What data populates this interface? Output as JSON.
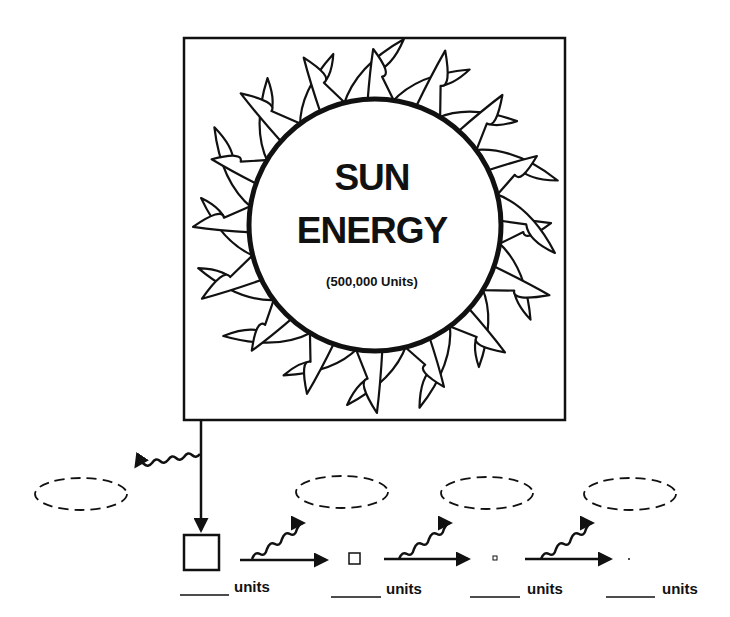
{
  "diagram": {
    "sun": {
      "title_line1": "SUN",
      "title_line2": "ENERGY",
      "amount": "(500,000 Units)"
    },
    "levels": [
      {
        "box_size": "large",
        "blank": "______",
        "label": "units"
      },
      {
        "box_size": "medium",
        "blank": "______",
        "label": "units"
      },
      {
        "box_size": "small",
        "blank": "______",
        "label": "units"
      },
      {
        "box_size": "dot",
        "blank": "______",
        "label": "units"
      }
    ],
    "heat_loss_ovals": [
      {
        "position": "left-of-first-level",
        "content": ""
      },
      {
        "position": "above-transfer-1",
        "content": ""
      },
      {
        "position": "above-transfer-2",
        "content": ""
      },
      {
        "position": "above-transfer-3",
        "content": ""
      }
    ],
    "colors": {
      "ink": "#111111",
      "background": "#ffffff"
    }
  }
}
